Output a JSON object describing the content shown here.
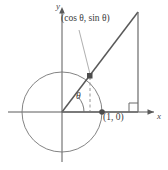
{
  "figure": {
    "colors": {
      "axis": "#5a5a5a",
      "circle": "#6e6e6e",
      "ray": "#555555",
      "triangle": "#6a6a6a",
      "dashed": "#8a8a8a",
      "leader": "#8e8e8e",
      "point_fill": "#4d4d4d",
      "text": "#3a3a3a",
      "background": "#ffffff"
    },
    "axes": {
      "x_label": "x",
      "y_label": "y",
      "origin": {
        "x": 62,
        "y": 112
      }
    },
    "circle": {
      "center": {
        "x": 62,
        "y": 112
      },
      "radius": 40
    },
    "angle": {
      "symbol": "θ",
      "arc_radius": 22
    },
    "points": [
      {
        "name": "point-on-circle",
        "label": "(cos θ, sin θ)",
        "x": 90,
        "y": 76
      },
      {
        "name": "point-unit-x",
        "label": "(1, 0)",
        "x": 102,
        "y": 112
      }
    ],
    "triangle": {
      "vertex_apex": {
        "x": 138,
        "y": 12
      },
      "vertex_right": {
        "x": 138,
        "y": 112
      },
      "right_angle_marker": true
    }
  }
}
